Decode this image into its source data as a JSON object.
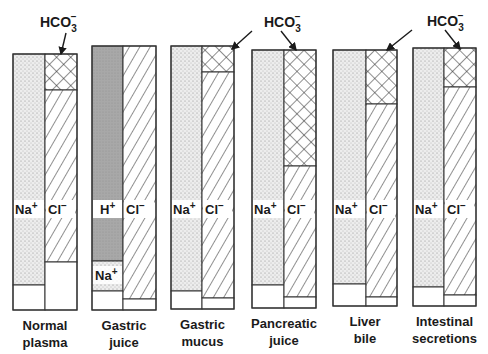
{
  "annotation": {
    "label": "HCO",
    "sub": "3",
    "sup": "−"
  },
  "ion_labels": {
    "na": "Na",
    "na_sup": "+",
    "cl": "Cl",
    "cl_sup": "−",
    "h": "H",
    "h_sup": "+"
  },
  "colors": {
    "outline": "#333333",
    "stipple_bg": "#ececec",
    "gray_fill": "#a8a8a8",
    "hatch": "#333333"
  },
  "columns": [
    {
      "id": "normal-plasma",
      "line1": "Normal",
      "line2": "plasma",
      "x": 13,
      "w": 64,
      "split": 45,
      "top": 54,
      "bottom": 310,
      "left": [
        {
          "type": "stipple",
          "y1": 54,
          "y2": 285
        },
        {
          "type": "white",
          "y1": 285,
          "y2": 310
        }
      ],
      "right": [
        {
          "type": "cross",
          "y1": 54,
          "y2": 90
        },
        {
          "type": "hatch",
          "y1": 90,
          "y2": 262
        },
        {
          "type": "white",
          "y1": 262,
          "y2": 310
        }
      ],
      "left_label": "na",
      "label_y": 214
    },
    {
      "id": "gastric-juice",
      "line1": "Gastric",
      "line2": "juice",
      "x": 92,
      "w": 64,
      "split": 123,
      "top": 46,
      "bottom": 310,
      "left": [
        {
          "type": "gray",
          "y1": 46,
          "y2": 261
        },
        {
          "type": "stipple",
          "y1": 261,
          "y2": 291
        },
        {
          "type": "white",
          "y1": 291,
          "y2": 310
        }
      ],
      "right": [
        {
          "type": "hatch",
          "y1": 46,
          "y2": 299
        },
        {
          "type": "white",
          "y1": 299,
          "y2": 310
        }
      ],
      "left_label": "h",
      "label_y": 214,
      "extra_label": {
        "ion": "na",
        "y": 280
      }
    },
    {
      "id": "gastric-mucus",
      "line1": "Gastric",
      "line2": "mucus",
      "x": 171,
      "w": 63,
      "split": 202,
      "top": 46,
      "bottom": 309,
      "left": [
        {
          "type": "stipple",
          "y1": 46,
          "y2": 291
        },
        {
          "type": "white",
          "y1": 291,
          "y2": 309
        }
      ],
      "right": [
        {
          "type": "cross",
          "y1": 46,
          "y2": 72
        },
        {
          "type": "hatch",
          "y1": 72,
          "y2": 298
        },
        {
          "type": "white",
          "y1": 298,
          "y2": 309
        }
      ],
      "left_label": "na",
      "label_y": 214
    },
    {
      "id": "pancreatic-juice",
      "line1": "Pancreatic",
      "line2": "juice",
      "x": 252,
      "w": 64,
      "split": 284,
      "top": 50,
      "bottom": 308,
      "left": [
        {
          "type": "stipple",
          "y1": 50,
          "y2": 285
        },
        {
          "type": "white",
          "y1": 285,
          "y2": 308
        }
      ],
      "right": [
        {
          "type": "cross",
          "y1": 50,
          "y2": 166
        },
        {
          "type": "hatch",
          "y1": 166,
          "y2": 297
        },
        {
          "type": "white",
          "y1": 297,
          "y2": 308
        }
      ],
      "left_label": "na",
      "label_y": 214
    },
    {
      "id": "liver-bile",
      "line1": "Liver",
      "line2": "bile",
      "x": 333,
      "w": 64,
      "split": 366,
      "top": 50,
      "bottom": 306,
      "left": [
        {
          "type": "stipple",
          "y1": 50,
          "y2": 284
        },
        {
          "type": "white",
          "y1": 284,
          "y2": 306
        }
      ],
      "right": [
        {
          "type": "cross",
          "y1": 50,
          "y2": 104
        },
        {
          "type": "hatch",
          "y1": 104,
          "y2": 297
        },
        {
          "type": "white",
          "y1": 297,
          "y2": 306
        }
      ],
      "left_label": "na",
      "label_y": 214
    },
    {
      "id": "intestinal-secretions",
      "line1": "Intestinal",
      "line2": "secretions",
      "x": 413,
      "w": 63,
      "split": 444,
      "top": 48,
      "bottom": 306,
      "left": [
        {
          "type": "stipple",
          "y1": 48,
          "y2": 287
        },
        {
          "type": "white",
          "y1": 287,
          "y2": 306
        }
      ],
      "right": [
        {
          "type": "cross",
          "y1": 48,
          "y2": 87
        },
        {
          "type": "hatch",
          "y1": 87,
          "y2": 295
        },
        {
          "type": "white",
          "y1": 295,
          "y2": 306
        }
      ],
      "left_label": "na",
      "label_y": 214
    }
  ],
  "hco3_labels": [
    {
      "x": 40,
      "y": 27,
      "arrows": [
        {
          "x1": 66,
          "y1": 33,
          "x2": 61,
          "y2": 54
        }
      ]
    },
    {
      "x": 264,
      "y": 27,
      "arrows": [
        {
          "x1": 252,
          "y1": 31,
          "x2": 232,
          "y2": 49
        },
        {
          "x1": 281,
          "y1": 31,
          "x2": 296,
          "y2": 50
        }
      ]
    },
    {
      "x": 427,
      "y": 26,
      "arrows": [
        {
          "x1": 412,
          "y1": 30,
          "x2": 387,
          "y2": 50
        },
        {
          "x1": 445,
          "y1": 30,
          "x2": 460,
          "y2": 49
        }
      ]
    }
  ]
}
